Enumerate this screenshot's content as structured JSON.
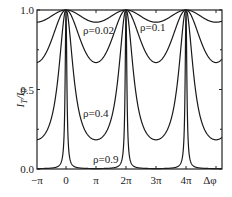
{
  "chart_data": {
    "type": "line",
    "title": "",
    "xlabel": "Δφ",
    "ylabel": "I_T/I_0",
    "xlim": [
      -3.14159,
      16.4
    ],
    "ylim": [
      0.0,
      1.0
    ],
    "grid": false,
    "legend": "inline labels",
    "x_ticks": [
      "−π",
      "0",
      "π",
      "2π",
      "3π",
      "4π",
      "Δφ"
    ],
    "y_ticks": [
      "0.0",
      "0.5",
      "1.0"
    ],
    "function": "Airy transmission I_T/I_0 = 1/(1 + F sin^2(Δφ/2)), F = 4ρ/(1−ρ)^2",
    "series": [
      {
        "name": "ρ=0.02",
        "rho": 0.02,
        "min_value": 0.92
      },
      {
        "name": "ρ=0.1",
        "rho": 0.1,
        "min_value": 0.67
      },
      {
        "name": "ρ=0.4",
        "rho": 0.4,
        "min_value": 0.18
      },
      {
        "name": "ρ=0.9",
        "rho": 0.9,
        "min_value": 0.003
      }
    ],
    "peaks_at": [
      "0",
      "2π",
      "4π"
    ]
  },
  "axes": {
    "y_label": "I",
    "y_label_sub1": "T",
    "y_label_mid": "/I",
    "y_label_sub2": "0"
  }
}
